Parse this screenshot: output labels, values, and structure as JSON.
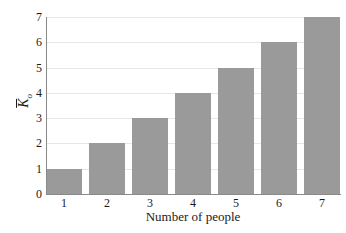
{
  "chart_data": {
    "type": "bar",
    "title": "",
    "subtitle": "",
    "categories": [
      "1",
      "2",
      "3",
      "4",
      "5",
      "6",
      "7"
    ],
    "values": [
      1,
      2,
      3,
      4,
      5,
      6,
      7
    ],
    "xlabel": "Number of people",
    "ylabel": "K̄ₒ",
    "ylabel_base": "K",
    "ylabel_subscript": "o",
    "ylabel_has_overbar": true,
    "ylim": [
      0,
      7
    ],
    "xlim": [
      0,
      7
    ],
    "y_ticks": [
      "7",
      "6",
      "5",
      "4",
      "3",
      "2",
      "1",
      "0"
    ],
    "y_tick_values": [
      7,
      6,
      5,
      4,
      3,
      2,
      1,
      0
    ],
    "x_ticks": [
      "1",
      "2",
      "3",
      "4",
      "5",
      "6",
      "7"
    ],
    "grid": true,
    "grid_axis": "y",
    "legend": null,
    "legend_position": "none",
    "annotations": [],
    "colors": {
      "bar_fill": "#9a9a9a",
      "gridline": "#e6e6e6",
      "axis_line": "#8a8a8a",
      "text": "#1a1a1a",
      "background": "#ffffff"
    }
  }
}
